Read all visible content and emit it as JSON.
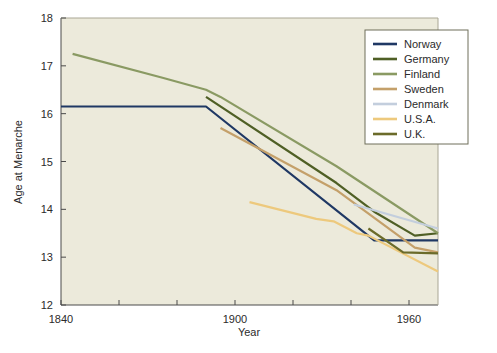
{
  "chart_data": {
    "type": "line",
    "title": "",
    "xlabel": "Year",
    "ylabel": "Age at Menarche",
    "xlim": [
      1840,
      1970
    ],
    "ylim": [
      12,
      18
    ],
    "xticks": [
      1840,
      1900,
      1960
    ],
    "xticklabels": [
      "1840",
      "1900",
      "1960"
    ],
    "xminorticks": [
      1860,
      1880,
      1920,
      1940
    ],
    "yticks": [
      12,
      13,
      14,
      15,
      16,
      17,
      18
    ],
    "yticklabels": [
      "12",
      "13",
      "14",
      "15",
      "16",
      "17",
      "18"
    ],
    "grid": false,
    "legend_position": "upper right",
    "plot_background": "#eceadb",
    "series": [
      {
        "name": "Norway",
        "color": "#1f3864",
        "x": [
          1840,
          1890,
          1948,
          1970
        ],
        "y": [
          16.15,
          16.15,
          13.35,
          13.35
        ]
      },
      {
        "name": "Germany",
        "color": "#4f5f25",
        "x": [
          1890,
          1935,
          1948,
          1962,
          1970
        ],
        "y": [
          16.35,
          14.55,
          13.95,
          13.45,
          13.5
        ]
      },
      {
        "name": "Finland",
        "color": "#8a9a63",
        "x": [
          1844,
          1875,
          1890,
          1895,
          1935,
          1970
        ],
        "y": [
          17.25,
          16.75,
          16.5,
          16.35,
          14.9,
          13.5
        ]
      },
      {
        "name": "Sweden",
        "color": "#c4a06a",
        "x": [
          1895,
          1935,
          1962,
          1970
        ],
        "y": [
          15.7,
          14.4,
          13.2,
          13.1
        ]
      },
      {
        "name": "Denmark",
        "color": "#c3cedd",
        "x": [
          1941,
          1970
        ],
        "y": [
          14.1,
          13.6
        ]
      },
      {
        "name": "U.S.A.",
        "color": "#edc97d",
        "x": [
          1905,
          1928,
          1934,
          1942,
          1946,
          1970
        ],
        "y": [
          14.15,
          13.8,
          13.75,
          13.5,
          13.45,
          12.7
        ]
      },
      {
        "name": "U.K.",
        "color": "#6b6b2a",
        "x": [
          1946,
          1958,
          1970
        ],
        "y": [
          13.6,
          13.1,
          13.08
        ]
      }
    ]
  },
  "legend": {
    "entries": [
      {
        "label": "Norway"
      },
      {
        "label": "Germany"
      },
      {
        "label": "Finland"
      },
      {
        "label": "Sweden"
      },
      {
        "label": "Denmark"
      },
      {
        "label": "U.S.A."
      },
      {
        "label": "U.K."
      }
    ]
  }
}
